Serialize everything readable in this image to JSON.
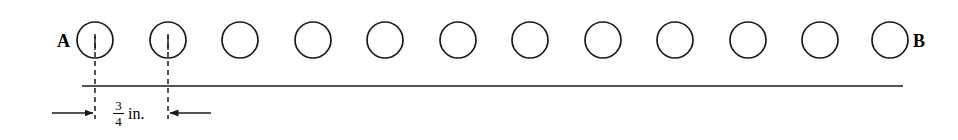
{
  "figure": {
    "type": "technical-dimension-diagram",
    "background_color": "#ffffff",
    "stroke_color": "#1a1a1a",
    "labels": {
      "left_endpoint": "A",
      "right_endpoint": "B"
    },
    "dimension": {
      "numerator": "3",
      "denominator": "4",
      "unit": "in.",
      "full_text": "3/4 in.",
      "measures": "center-to-center spacing between first and second circle"
    },
    "circles": {
      "count": 12,
      "radius": 18,
      "center_y": 40,
      "centers_x": [
        95,
        168,
        240,
        313,
        385,
        458,
        530,
        603,
        675,
        748,
        820,
        890
      ],
      "with_centerline": [
        95,
        168
      ]
    },
    "reference_line": {
      "y": 86,
      "x_start": 82,
      "x_end": 903
    },
    "extension_lines": {
      "dash_pattern": "5,4",
      "y_top": 38,
      "y_bottom": 119,
      "x_positions": [
        95,
        168
      ]
    },
    "arrows": {
      "left": {
        "from_x": 52,
        "to_x": 93,
        "y": 113,
        "direction": "right"
      },
      "right": {
        "from_x": 211,
        "to_x": 170,
        "y": 113,
        "direction": "left"
      }
    }
  }
}
